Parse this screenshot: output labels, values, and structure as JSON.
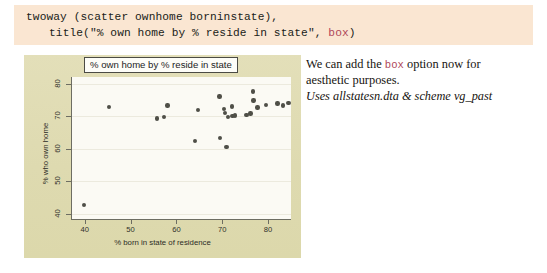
{
  "code": {
    "line1": "twoway (scatter ownhome borninstate),",
    "line2_pre": "title(\"% own home by % reside in state\", ",
    "line2_kw": "box",
    "line2_post": ")",
    "bg_color": "#fae6d2",
    "keyword_color": "#b0485a"
  },
  "annotation": {
    "line1_pre": "We can add the ",
    "line1_kw": "box",
    "line1_post": " option now for",
    "line2": "aesthetic purposes.",
    "line3": "Uses allstatesn.dta & scheme vg_past"
  },
  "chart_data": {
    "type": "scatter",
    "title": "% own home by % reside in state",
    "xlabel": "% born in state of residence",
    "ylabel": "% who own home",
    "xlim": [
      37,
      85
    ],
    "ylim": [
      38,
      82
    ],
    "xticks": [
      40,
      50,
      60,
      70,
      80
    ],
    "yticks": [
      40,
      50,
      60,
      70,
      80
    ],
    "grid": true,
    "grid_orientation": "horizontal",
    "scheme": "vg_past",
    "marker_color": "#4f4f47",
    "plot_bg_color": "#fbfaf4",
    "graph_bg_color": "#e0dcb4",
    "points": [
      {
        "x": 39.6,
        "y": 42.6
      },
      {
        "x": 45.0,
        "y": 72.7
      },
      {
        "x": 55.5,
        "y": 69.2
      },
      {
        "x": 57.0,
        "y": 69.7
      },
      {
        "x": 57.8,
        "y": 73.3
      },
      {
        "x": 63.8,
        "y": 62.4
      },
      {
        "x": 64.5,
        "y": 71.8
      },
      {
        "x": 69.2,
        "y": 76.0
      },
      {
        "x": 69.3,
        "y": 63.2
      },
      {
        "x": 70.2,
        "y": 72.2
      },
      {
        "x": 70.4,
        "y": 71.0
      },
      {
        "x": 70.7,
        "y": 60.4
      },
      {
        "x": 71.0,
        "y": 69.8
      },
      {
        "x": 71.9,
        "y": 73.0
      },
      {
        "x": 72.0,
        "y": 70.1
      },
      {
        "x": 72.6,
        "y": 70.2
      },
      {
        "x": 75.1,
        "y": 70.3
      },
      {
        "x": 75.9,
        "y": 70.8
      },
      {
        "x": 76.5,
        "y": 77.5
      },
      {
        "x": 76.6,
        "y": 74.8
      },
      {
        "x": 77.5,
        "y": 72.6
      },
      {
        "x": 79.3,
        "y": 73.4
      },
      {
        "x": 81.8,
        "y": 73.9
      },
      {
        "x": 83.0,
        "y": 73.3
      },
      {
        "x": 84.2,
        "y": 74.1
      }
    ]
  }
}
